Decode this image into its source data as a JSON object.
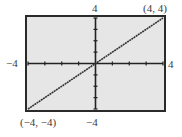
{
  "chart_data": {
    "type": "line",
    "title": "",
    "xlabel": "",
    "ylabel": "",
    "xlim": [
      -4,
      4
    ],
    "ylim": [
      -4,
      4
    ],
    "x_tick_step": 1,
    "y_tick_step": 1,
    "grid": false,
    "series": [
      {
        "name": "y = x",
        "x": [
          -4,
          4
        ],
        "y": [
          -4,
          4
        ]
      }
    ],
    "annotations": [
      {
        "text": "(4, 4)",
        "x": 4,
        "y": 4
      },
      {
        "text": "(−4, −4)",
        "x": -4,
        "y": -4
      }
    ],
    "axis_labels": {
      "x_min": "−4",
      "x_max": "4",
      "y_min": "−4",
      "y_max": "4"
    }
  },
  "colors": {
    "plot_background": "#e6e6e6",
    "frame": "#2a2a2a",
    "axis": "#222222",
    "line": "#333333"
  }
}
